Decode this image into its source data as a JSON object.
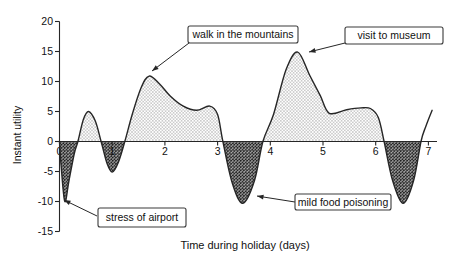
{
  "axes": {
    "y_title": "Instant utility",
    "x_title": "Time during holiday (days)",
    "y_ticks": [
      20,
      15,
      10,
      5,
      0,
      -5,
      -10,
      -15
    ],
    "x_ticks": [
      0,
      1,
      2,
      3,
      4,
      5,
      6,
      7
    ]
  },
  "colors": {
    "line": "#262626",
    "axis": "#262626",
    "text": "#111111",
    "dot_pattern_dot": "#6f6f6f",
    "checker_dark": "#1f1f1f",
    "checker_mid": "#8c8c8c",
    "box_border": "#3a3a3a",
    "box_fill": "#ffffff",
    "covered_tick_label": "#d4d4d4"
  },
  "chart_data": {
    "type": "area",
    "title": "",
    "xlabel": "Time during holiday (days)",
    "ylabel": "Instant utility",
    "xlim": [
      0,
      7.15
    ],
    "ylim": [
      -15,
      20
    ],
    "grid": false,
    "fill_positive": "light-dot-pattern",
    "fill_negative": "dark-checker-pattern",
    "x": [
      0.0,
      0.03,
      0.1,
      0.18,
      0.28,
      0.35,
      0.45,
      0.55,
      0.68,
      0.79,
      0.9,
      1.0,
      1.12,
      1.24,
      1.38,
      1.55,
      1.7,
      1.9,
      2.1,
      2.35,
      2.6,
      2.85,
      3.0,
      3.1,
      3.28,
      3.48,
      3.7,
      3.86,
      4.06,
      4.3,
      4.52,
      4.75,
      4.95,
      5.12,
      5.45,
      5.72,
      5.9,
      6.05,
      6.16,
      6.32,
      6.52,
      6.72,
      6.86,
      6.95,
      7.07
    ],
    "y": [
      0,
      -4,
      -10,
      -6.5,
      -2,
      0,
      3.6,
      5.0,
      3.4,
      0,
      -3.6,
      -5.1,
      -3.4,
      0,
      4.5,
      9.0,
      10.9,
      9.6,
      7.6,
      5.9,
      5.2,
      5.9,
      4.5,
      0,
      -7.0,
      -10.3,
      -6.5,
      0,
      4.5,
      12.0,
      14.9,
      11.0,
      7.6,
      4.7,
      5.3,
      5.6,
      5.5,
      4.0,
      0,
      -6.5,
      -10.3,
      -6.5,
      0,
      2.5,
      5.2
    ],
    "key_events": [
      {
        "label": "stress of airport",
        "day": 0.1,
        "utility": -10
      },
      {
        "label": "walk in the mountains",
        "day": 1.7,
        "utility": 10.9
      },
      {
        "label": "mild food poisoning",
        "day": 3.5,
        "utility": -10.3
      },
      {
        "label": "visit to museum",
        "day": 4.5,
        "utility": 14.9
      }
    ],
    "annotations": [
      {
        "text": "walk in the mountains",
        "box_px": [
          188,
          26,
          110,
          17
        ],
        "from_px": [
          189,
          43
        ],
        "to_px": [
          152,
          71
        ]
      },
      {
        "text": "visit to museum",
        "box_px": [
          345,
          27,
          98,
          17
        ],
        "from_px": [
          345,
          43
        ],
        "to_px": [
          309,
          52
        ]
      },
      {
        "text": "stress of airport",
        "box_px": [
          98,
          208,
          88,
          19
        ],
        "from_px": [
          97,
          216
        ],
        "to_px": [
          64,
          200
        ]
      },
      {
        "text": "mild food poisoning",
        "box_px": [
          295,
          194,
          96,
          16
        ],
        "from_px": [
          295,
          202
        ],
        "to_px": [
          257,
          196
        ]
      }
    ],
    "covered_x_tick": "1"
  }
}
